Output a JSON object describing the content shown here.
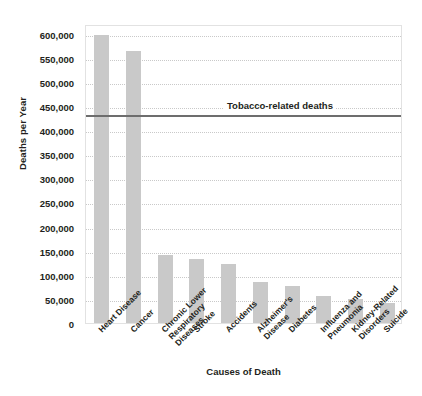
{
  "chart_data": {
    "type": "bar",
    "title": "",
    "xlabel": "Causes of Death",
    "ylabel": "Deaths per Year",
    "ylim": [
      0,
      620000
    ],
    "ytick_values": [
      0,
      50000,
      100000,
      150000,
      200000,
      250000,
      300000,
      350000,
      400000,
      450000,
      500000,
      550000,
      600000
    ],
    "ytick_labels": [
      "0",
      "50,000",
      "100,000",
      "150,000",
      "200,000",
      "250,000",
      "300,000",
      "350,000",
      "400,000",
      "450,000",
      "500,000",
      "550,000",
      "600,000"
    ],
    "grid": true,
    "legend": "none",
    "categories": [
      "Heart Disease",
      "Cancer",
      "Chronic Lower Respiratory Diseases",
      "Stroke",
      "Accidents",
      "Alzheimer's Disease",
      "Diabetes",
      "Influenza and Pneumonia",
      "Kidney-Related Disorders",
      "Suicide"
    ],
    "category_label_lines": [
      [
        "Heart Disease"
      ],
      [
        "Cancer"
      ],
      [
        "Chronic Lower",
        "Respiratory",
        "Diseases"
      ],
      [
        "Stroke"
      ],
      [
        "Accidents"
      ],
      [
        "Alzheimer's",
        "Disease"
      ],
      [
        "Diabetes"
      ],
      [
        "Influenza and",
        "Pneumonia"
      ],
      [
        "Kidney-Related",
        "Disorders"
      ],
      [
        "Suicide"
      ]
    ],
    "values": [
      597000,
      565000,
      140000,
      133000,
      122000,
      85000,
      76000,
      57000,
      50000,
      42000
    ],
    "bar_color": "#c9c9c9",
    "annotations": [
      {
        "type": "hline",
        "label": "Tobacco-related deaths",
        "value": 435000,
        "color": "#6d6d6d"
      }
    ]
  }
}
